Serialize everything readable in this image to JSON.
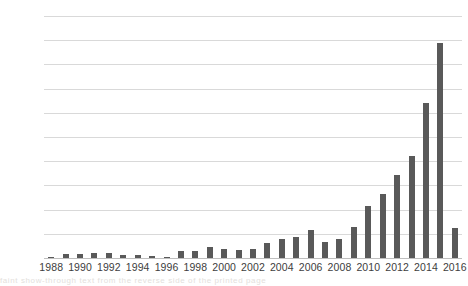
{
  "figure": {
    "name": "yearly-bar-chart",
    "background_color": "#ffffff",
    "bar_color": "#595959",
    "gridline_color": "#d9d9d9",
    "axis_text_color": "#404040"
  },
  "chart_data": {
    "type": "bar",
    "title": "",
    "subtitle": "",
    "xlabel": "",
    "ylabel": "",
    "ylim": [
      0,
      2000
    ],
    "ytick_values": [
      0,
      200,
      400,
      600,
      800,
      1000,
      1200,
      1400,
      1600,
      1800,
      2000
    ],
    "ytick_labels": [
      "0",
      "200",
      "400",
      "600",
      "800",
      "1000",
      "1200",
      "1400",
      "1600",
      "1800",
      "2000"
    ],
    "xtick_labels": [
      "1988",
      "1990",
      "1992",
      "1994",
      "1996",
      "1998",
      "2000",
      "2002",
      "2004",
      "2006",
      "2008",
      "2010",
      "2012",
      "2014",
      "2016"
    ],
    "grid": true,
    "grid_axis": "y",
    "legend": false,
    "legend_position": "none",
    "categories": [
      "1988",
      "1989",
      "1990",
      "1991",
      "1992",
      "1993",
      "1994",
      "1995",
      "1996",
      "1997",
      "1998",
      "1999",
      "2000",
      "2001",
      "2002",
      "2003",
      "2004",
      "2005",
      "2006",
      "2007",
      "2008",
      "2009",
      "2010",
      "2011",
      "2012",
      "2013",
      "2014",
      "2015",
      "2016"
    ],
    "values": [
      8,
      30,
      32,
      38,
      40,
      26,
      22,
      18,
      12,
      60,
      62,
      92,
      72,
      70,
      78,
      120,
      160,
      175,
      230,
      130,
      155,
      260,
      430,
      530,
      690,
      840,
      1280,
      1780,
      250
    ]
  },
  "page_bleed": {
    "text": "faint show-through text from the reverse side of the printed page"
  }
}
